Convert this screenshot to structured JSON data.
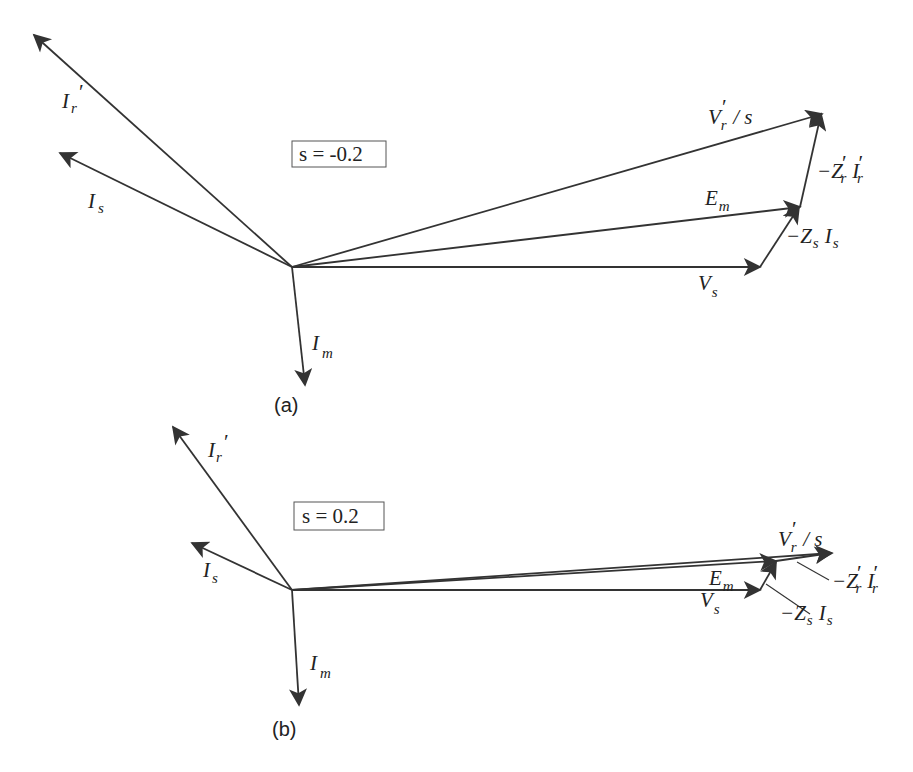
{
  "figure": {
    "panels": [
      {
        "id": "a",
        "caption": "(a)",
        "slip_label": "s = -0.2",
        "labels": {
          "Ir_main": "I",
          "Ir_sub": "r",
          "Ir_prime": "′",
          "Is_main": "I",
          "Is_sub": "s",
          "Im_main": "I",
          "Im_sub": "m",
          "Vs_main": "V",
          "Vs_sub": "s",
          "Em_main": "E",
          "Em_sub": "m",
          "Vr_main": "V",
          "Vr_sub": "r",
          "Vr_prime": "′",
          "Vr_rest": "/ s",
          "ZsIs_main": "−Z",
          "ZsIs_sub": "s",
          "ZsIs_I": "I",
          "ZsIs_Isub": "s",
          "ZrIr_main": "−Z",
          "ZrIr_prime": "′",
          "ZrIr_sub": "r",
          "ZrIr_I": "I",
          "ZrIr_Iprime": "′",
          "ZrIr_Isub": "r"
        }
      },
      {
        "id": "b",
        "caption": "(b)",
        "slip_label": "s = 0.2",
        "labels": {
          "Ir_main": "I",
          "Ir_sub": "r",
          "Ir_prime": "′",
          "Is_main": "I",
          "Is_sub": "s",
          "Im_main": "I",
          "Im_sub": "m",
          "Vs_main": "V",
          "Vs_sub": "s",
          "Em_main": "E",
          "Em_sub": "m",
          "Vr_main": "V",
          "Vr_sub": "r",
          "Vr_prime": "′",
          "Vr_rest": "/ s",
          "ZsIs_main": "−Z",
          "ZsIs_sub": "s",
          "ZsIs_I": "I",
          "ZsIs_Isub": "s",
          "ZrIr_main": "−Z",
          "ZrIr_prime": "′",
          "ZrIr_sub": "r",
          "ZrIr_I": "I",
          "ZrIr_Iprime": "′",
          "ZrIr_Isub": "r"
        }
      }
    ],
    "colors": {
      "stroke": "#333333",
      "text": "#222222",
      "background": "#ffffff"
    }
  }
}
